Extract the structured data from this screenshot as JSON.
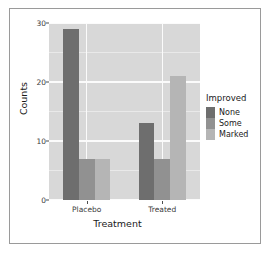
{
  "chart_data": {
    "type": "bar",
    "title": "",
    "xlabel": "Treatment",
    "ylabel": "Counts",
    "categories": [
      "Placebo",
      "Treated"
    ],
    "series": [
      {
        "name": "None",
        "values": [
          29,
          13
        ],
        "color": "#6e6e6e"
      },
      {
        "name": "Some",
        "values": [
          7,
          7
        ],
        "color": "#919191"
      },
      {
        "name": "Marked",
        "values": [
          7,
          21
        ],
        "color": "#b5b5b5"
      }
    ],
    "legend_title": "Improved",
    "legend_position": "right",
    "ylim": [
      0,
      30
    ],
    "yticks": [
      0,
      10,
      20,
      30
    ],
    "ytick_labels": [
      "0",
      "10",
      "20",
      "30"
    ],
    "y_minor_ticks": [
      5,
      15,
      25
    ],
    "grid": true,
    "panel_background": "#d8d8d8",
    "grid_color": "#fbfbfb"
  }
}
